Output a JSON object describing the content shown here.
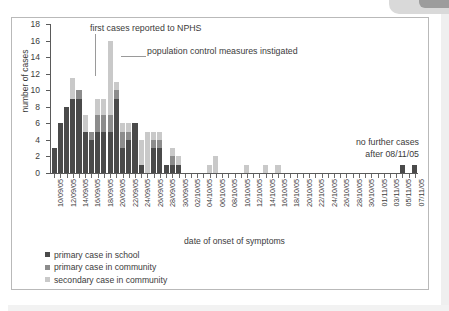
{
  "chart_data": {
    "type": "bar",
    "subtype": "stacked-bar-epidemic-curve",
    "title": "",
    "xlabel": "date of onset of symptoms",
    "ylabel": "number of cases",
    "ylim": [
      0,
      18
    ],
    "ytick_values": [
      0,
      2,
      4,
      6,
      8,
      10,
      12,
      14,
      16,
      18
    ],
    "grid": false,
    "legend_position": "below-axis-left",
    "categories": [
      "10/09/05",
      "11/09/05",
      "12/09/05",
      "13/09/05",
      "14/09/05",
      "15/09/05",
      "16/09/05",
      "17/09/05",
      "18/09/05",
      "19/09/05",
      "20/09/05",
      "21/09/05",
      "22/09/05",
      "23/09/05",
      "24/09/05",
      "25/09/05",
      "26/09/05",
      "27/09/05",
      "28/09/05",
      "29/09/05",
      "30/09/05",
      "01/10/05",
      "02/10/05",
      "03/10/05",
      "04/10/05",
      "05/10/05",
      "06/10/05",
      "07/10/05",
      "08/10/05",
      "09/10/05",
      "10/10/05",
      "11/10/05",
      "12/10/05",
      "13/10/05",
      "14/10/05",
      "15/10/05",
      "16/10/05",
      "17/10/05",
      "18/10/05",
      "19/10/05",
      "20/10/05",
      "21/10/05",
      "22/10/05",
      "23/10/05",
      "24/10/05",
      "25/10/05",
      "26/10/05",
      "27/10/05",
      "28/10/05",
      "29/10/05",
      "30/10/05",
      "31/10/05",
      "01/11/05",
      "02/11/05",
      "03/11/05",
      "04/11/05",
      "05/11/05",
      "06/11/05",
      "07/11/05"
    ],
    "tick_labels_shown": [
      "10/09/05",
      "12/09/05",
      "14/09/05",
      "16/09/05",
      "18/09/05",
      "20/09/05",
      "22/09/05",
      "24/09/05",
      "26/09/05",
      "28/09/05",
      "30/09/05",
      "02/10/05",
      "04/10/05",
      "06/10/05",
      "08/10/05",
      "10/10/05",
      "12/10/05",
      "14/10/05",
      "16/10/05",
      "18/10/05",
      "20/10/05",
      "22/10/05",
      "24/10/05",
      "26/10/05",
      "28/10/05",
      "30/10/05",
      "01/11/05",
      "03/11/05",
      "05/11/05",
      "07/11/05"
    ],
    "series": [
      {
        "name": "primary case in school",
        "color": "#4a4a4a",
        "values": [
          3,
          6,
          8,
          9,
          9,
          5,
          4,
          5,
          5,
          5,
          9,
          3,
          4,
          6,
          1,
          0,
          3,
          3,
          1,
          1,
          1,
          0,
          0,
          0,
          0,
          0,
          0,
          0,
          0,
          0,
          0,
          0,
          0,
          0,
          0,
          0,
          0,
          0,
          0,
          0,
          0,
          0,
          0,
          0,
          0,
          0,
          0,
          0,
          0,
          0,
          0,
          0,
          0,
          0,
          0,
          0,
          1,
          0,
          1
        ]
      },
      {
        "name": "primary case in community",
        "color": "#8c8c8c",
        "values": [
          0,
          0,
          0,
          0,
          1,
          0,
          1,
          2,
          2,
          2,
          1,
          2,
          1,
          0,
          0,
          0,
          1,
          1,
          0,
          1,
          0,
          0,
          0,
          0,
          0,
          0,
          0,
          0,
          0,
          0,
          0,
          0,
          0,
          0,
          0,
          0,
          0,
          0,
          0,
          0,
          0,
          0,
          0,
          0,
          0,
          0,
          0,
          0,
          0,
          0,
          0,
          0,
          0,
          0,
          0,
          0,
          0,
          0,
          0
        ]
      },
      {
        "name": "secondary case in community",
        "color": "#c9c9c9",
        "values": [
          0,
          0,
          0,
          2.5,
          0,
          2,
          0,
          2,
          2,
          9,
          1,
          1,
          1,
          0,
          3,
          5,
          1,
          1,
          0,
          1,
          1,
          0,
          0,
          0,
          0,
          1,
          2,
          0,
          0,
          0,
          0,
          1,
          0,
          0,
          1,
          0,
          1,
          0,
          0,
          0,
          0,
          0,
          0,
          0,
          0,
          0,
          0,
          0,
          0,
          0,
          0,
          0,
          0,
          0,
          0,
          0,
          0,
          0,
          0
        ]
      }
    ],
    "totals": [
      3,
      6,
      8,
      11.5,
      10,
      7,
      5,
      9,
      9,
      16,
      11,
      6,
      6,
      6,
      4,
      5,
      5,
      5,
      1,
      3,
      2,
      0,
      0,
      0,
      0,
      1,
      2,
      0,
      0,
      0,
      0,
      1,
      0,
      0,
      1,
      0,
      1,
      0,
      0,
      0,
      0,
      0,
      0,
      0,
      0,
      0,
      0,
      0,
      0,
      0,
      0,
      0,
      0,
      0,
      0,
      0,
      1,
      0,
      1
    ],
    "annotations": [
      {
        "id": "first-cases",
        "text": "first cases reported to NPHS",
        "points_to": "16/09/05"
      },
      {
        "id": "control-measures",
        "text": "population control measures instigated",
        "points_to": "19/09/05"
      },
      {
        "id": "no-further-cases",
        "text_line1": "no further cases",
        "text_line2": "after 08/11/05"
      }
    ]
  },
  "legend": {
    "items": [
      {
        "label": "primary case in school",
        "color": "#4a4a4a"
      },
      {
        "label": "primary case in community",
        "color": "#8c8c8c"
      },
      {
        "label": "secondary case in community",
        "color": "#c9c9c9"
      }
    ]
  }
}
